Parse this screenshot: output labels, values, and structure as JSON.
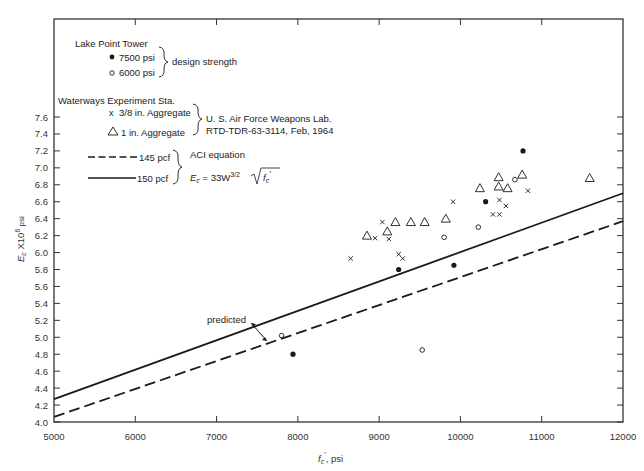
{
  "chart_data": {
    "type": "scatter",
    "title": "",
    "xlabel": "f'c, psi",
    "ylabel": "Ec X10^6 psi",
    "xlim": [
      5000,
      12000
    ],
    "ylim": [
      4.0,
      7.6
    ],
    "x_ticks": [
      5000,
      6000,
      7000,
      8000,
      9000,
      10000,
      11000,
      12000
    ],
    "y_ticks": [
      4.0,
      4.2,
      4.4,
      4.6,
      4.8,
      5.0,
      5.2,
      5.4,
      5.6,
      5.8,
      6.0,
      6.2,
      6.4,
      6.6,
      6.8,
      7.0,
      7.2,
      7.4,
      7.6
    ],
    "grid": false,
    "legend_position": "upper-left",
    "series": [
      {
        "name": "Lake Point Tower 7500 psi",
        "marker": "filled-circle",
        "points": [
          [
            10770,
            7.2
          ],
          [
            10310,
            6.6
          ],
          [
            9240,
            5.8
          ],
          [
            9920,
            5.85
          ],
          [
            7940,
            4.8
          ]
        ]
      },
      {
        "name": "Lake Point Tower 6000 psi",
        "marker": "open-circle",
        "points": [
          [
            10670,
            6.86
          ],
          [
            10220,
            6.3
          ],
          [
            9800,
            6.18
          ],
          [
            7800,
            5.02
          ],
          [
            9530,
            4.85
          ]
        ]
      },
      {
        "name": "Waterways Experiment Sta. 3/8 in. Aggregate",
        "marker": "x",
        "points": [
          [
            9040,
            6.36
          ],
          [
            8950,
            6.17
          ],
          [
            9120,
            6.16
          ],
          [
            8650,
            5.93
          ],
          [
            9240,
            5.98
          ],
          [
            9290,
            5.93
          ],
          [
            9910,
            6.6
          ],
          [
            10480,
            6.62
          ],
          [
            10560,
            6.55
          ],
          [
            10400,
            6.45
          ],
          [
            10480,
            6.45
          ],
          [
            10830,
            6.73
          ]
        ]
      },
      {
        "name": "Waterways Experiment Sta. 1 in. Aggregate",
        "marker": "open-triangle",
        "points": [
          [
            8850,
            6.2
          ],
          [
            9100,
            6.25
          ],
          [
            9200,
            6.36
          ],
          [
            9390,
            6.36
          ],
          [
            9560,
            6.36
          ],
          [
            9820,
            6.4
          ],
          [
            10240,
            6.76
          ],
          [
            10470,
            6.89
          ],
          [
            10470,
            6.78
          ],
          [
            10580,
            6.76
          ],
          [
            10760,
            6.92
          ],
          [
            11590,
            6.88
          ]
        ]
      },
      {
        "name": "ACI equation 145 pcf",
        "style": "dashed",
        "points": [
          [
            5000,
            4.06
          ],
          [
            12000,
            6.37
          ]
        ]
      },
      {
        "name": "ACI equation 150 pcf",
        "style": "solid",
        "points": [
          [
            5000,
            4.27
          ],
          [
            12000,
            6.7
          ]
        ]
      }
    ],
    "annotations": [
      {
        "text": "predicted",
        "arrow": "double-headed between predicted lines",
        "at": [
          7700,
          5.1
        ]
      }
    ]
  },
  "legend": {
    "lake_title": "Lake Point Tower",
    "lake_7500": "7500 psi",
    "lake_6000": "6000 psi",
    "design_strength": "design strength",
    "wes_title": "Waterways Experiment Sta.",
    "wes_38": "3/8 in. Aggregate",
    "wes_1": "1 in. Aggregate",
    "usaf_line1": "U. S. Air Force Weapons Lab.",
    "usaf_line2": "RTD-TDR-63-3114, Feb, 1964",
    "line_145": "145 pcf",
    "line_150": "150 pcf",
    "aci_title": "ACI equation",
    "aci_eq_lhs": "E",
    "aci_eq_sub": "c",
    "aci_eq_mid": " = 33W",
    "aci_eq_exp": "3/2",
    "aci_eq_rad": "f",
    "aci_eq_rad_sub": "c",
    "aci_eq_prime": "′"
  },
  "axes": {
    "x_title_main": "f",
    "x_title_sub": "c",
    "x_title_prime": "′",
    "x_title_unit": ", psi",
    "y_title_main": "E",
    "y_title_sub": "c",
    "y_title_mid": " X10",
    "y_title_exp": "6",
    "y_title_unit": " psi"
  },
  "annotation_label": "predicted",
  "colors": {
    "ink": "#1a1a1a",
    "axis": "#333333",
    "text": "#222222"
  }
}
